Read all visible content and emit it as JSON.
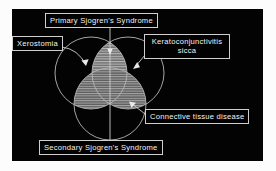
{
  "diagram": {
    "type": "venn",
    "background_color": "#030303",
    "line_color": "#c8c8c8",
    "text_color": "#f4f4f4",
    "labels": {
      "primary": "Primary Sjogren's Syndrome",
      "xerostomia": "Xerostomia",
      "keratoconjunctivitis_line1": "Keratoconjunctivitis",
      "keratoconjunctivitis_line2": "sicca",
      "connective_tissue": "Connective tissue disease",
      "secondary": "Secondary Sjogren's Syndrome"
    },
    "sets": [
      {
        "name": "Xerostomia",
        "position": "upper-left"
      },
      {
        "name": "Keratoconjunctivitis sicca",
        "position": "upper-right"
      },
      {
        "name": "Connective tissue disease",
        "position": "bottom"
      }
    ],
    "regions": [
      {
        "name": "Primary Sjogren's Syndrome",
        "members": [
          "Xerostomia",
          "Keratoconjunctivitis sicca"
        ],
        "shaded": true
      },
      {
        "name": "Secondary Sjogren's Syndrome",
        "members": [
          "Xerostomia",
          "Keratoconjunctivitis sicca",
          "Connective tissue disease"
        ],
        "shaded": true
      }
    ]
  }
}
